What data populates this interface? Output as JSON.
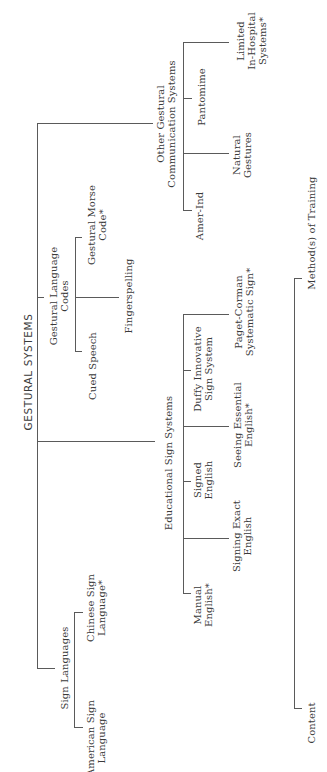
{
  "diagram": {
    "root": "GESTURAL SYSTEMS",
    "branches": [
      {
        "label": "Other Gestural\nCommunication Systems",
        "children": [
          "Amer-Ind",
          "Natural\nGestures",
          "Pantomime",
          "Limited\nIn-Hospital\nSystems*"
        ]
      },
      {
        "label": "Gestural Language\nCodes",
        "children": [
          "Cued Speech",
          "Fingerspelling",
          "Gestural Morse\nCode*"
        ]
      },
      {
        "label": "Educational Sign Systems",
        "children": [
          "Manual\nEnglish*",
          "Signing Exact\nEnglish",
          "Signed\nEnglish",
          "Seeing Essential\nEnglish*",
          "Duffy Innovative\nSign System",
          "Paget-Corman\nSystematic Sign*"
        ]
      },
      {
        "label": "Sign Languages",
        "children": [
          "American Sign\nLanguage",
          "Chinese Sign\nLanguage*"
        ]
      }
    ],
    "legend_axis": {
      "start": "Content",
      "end": "Method(s) of Training"
    }
  },
  "colors": {
    "line": "#5a5a5a",
    "text": "#3a3a3a",
    "background": "#ffffff"
  }
}
